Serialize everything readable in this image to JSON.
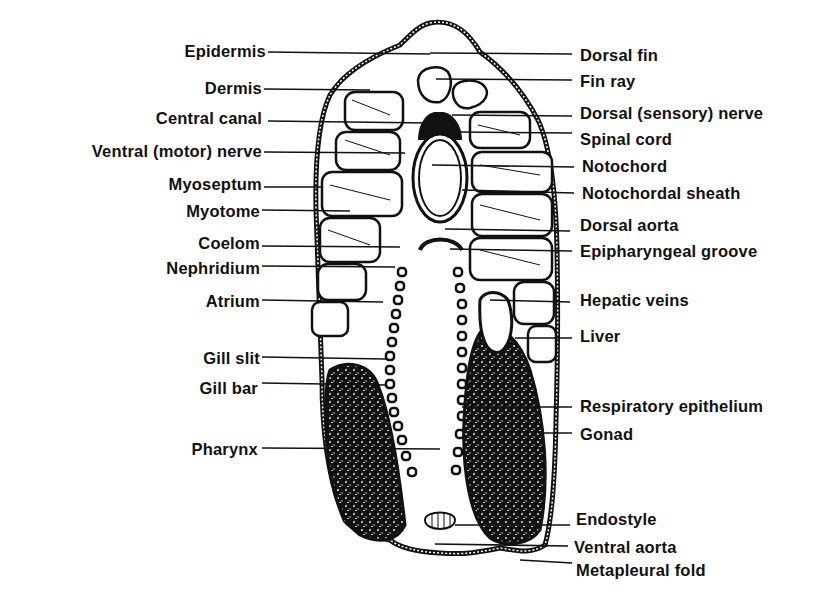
{
  "diagram": {
    "colors": {
      "ink": "#111111",
      "background": "#ffffff"
    },
    "left_labels": [
      {
        "text": "Epidermis",
        "y": 52
      },
      {
        "text": "Dermis",
        "y": 89
      },
      {
        "text": "Central canal",
        "y": 118
      },
      {
        "text": "Ventral (motor) nerve",
        "y": 151
      },
      {
        "text": "Myoseptum",
        "y": 184
      },
      {
        "text": "Myotome",
        "y": 211
      },
      {
        "text": "Coelom",
        "y": 243
      },
      {
        "text": "Nephridium",
        "y": 268
      },
      {
        "text": "Atrium",
        "y": 301
      },
      {
        "text": "Gill slit",
        "y": 358
      },
      {
        "text": "Gill bar",
        "y": 388
      },
      {
        "text": "Pharynx",
        "y": 449
      }
    ],
    "right_labels": [
      {
        "text": "Dorsal fin",
        "y": 55
      },
      {
        "text": "Fin ray",
        "y": 82
      },
      {
        "text": "Dorsal (sensory) nerve",
        "y": 114
      },
      {
        "text": "Spinal cord",
        "y": 140
      },
      {
        "text": "Notochord",
        "y": 167
      },
      {
        "text": "Notochordal sheath",
        "y": 193
      },
      {
        "text": "Dorsal aorta",
        "y": 226
      },
      {
        "text": "Epipharyngeal groove",
        "y": 252
      },
      {
        "text": "Hepatic veins",
        "y": 300
      },
      {
        "text": "Liver",
        "y": 336
      },
      {
        "text": "Respiratory epithelium",
        "y": 406
      },
      {
        "text": "Gonad",
        "y": 434
      },
      {
        "text": "Endostyle",
        "y": 519
      },
      {
        "text": "Ventral aorta",
        "y": 547
      },
      {
        "text": "Metapleural fold",
        "y": 570
      }
    ]
  }
}
